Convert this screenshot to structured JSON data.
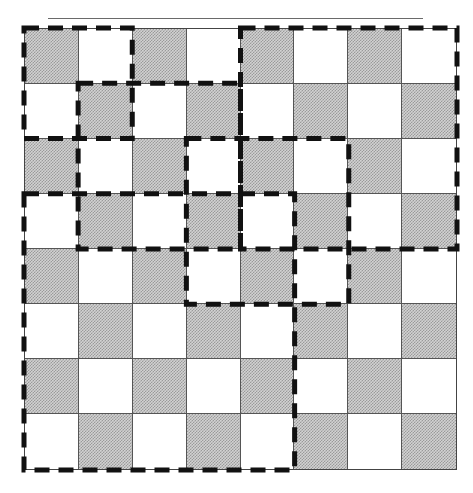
{
  "figure": {
    "type": "checkerboard-with-dashed-regions",
    "board": {
      "rows": 8,
      "cols": 8,
      "top_left_color": "dark",
      "colors": {
        "dark": "#c4c4c4",
        "light": "#ffffff",
        "grid_line": "#555555"
      }
    },
    "top_rule": {
      "color": "#6a6a6a"
    },
    "dashed_regions": [
      {
        "id": "A",
        "col_start": 0,
        "col_end": 2,
        "row_start": 0,
        "row_end": 2
      },
      {
        "id": "B",
        "col_start": 1,
        "col_end": 4,
        "row_start": 1,
        "row_end": 4
      },
      {
        "id": "C",
        "col_start": 4,
        "col_end": 8,
        "row_start": 0,
        "row_end": 4
      },
      {
        "id": "D",
        "col_start": 3,
        "col_end": 6,
        "row_start": 2,
        "row_end": 5
      },
      {
        "id": "E",
        "col_start": 0,
        "col_end": 5,
        "row_start": 3,
        "row_end": 8
      }
    ],
    "dash_style": {
      "color": "#111111",
      "stroke_width": 5,
      "dash": 15,
      "gap": 9
    }
  }
}
